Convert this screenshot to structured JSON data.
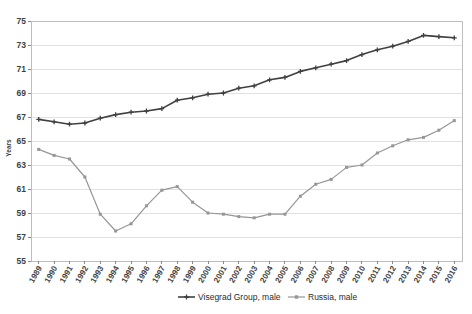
{
  "chart_data": {
    "type": "line",
    "title": "",
    "xlabel": "",
    "ylabel": "Years",
    "ylim": [
      55,
      75
    ],
    "ytick_step": 2,
    "yticks": [
      55,
      57,
      59,
      61,
      63,
      65,
      67,
      69,
      71,
      73,
      75
    ],
    "grid": true,
    "legend_position": "bottom",
    "x": [
      1989,
      1990,
      1991,
      1992,
      1993,
      1994,
      1995,
      1996,
      1997,
      1998,
      1999,
      2000,
      2001,
      2002,
      2003,
      2004,
      2005,
      2006,
      2007,
      2008,
      2009,
      2010,
      2011,
      2012,
      2013,
      2014,
      2015,
      2016
    ],
    "categories": [
      "1989",
      "1990",
      "1991",
      "1992",
      "1993",
      "1994",
      "1995",
      "1996",
      "1997",
      "1998",
      "1999",
      "2000",
      "2001",
      "2002",
      "2003",
      "2004",
      "2005",
      "2006",
      "2007",
      "2008",
      "2009",
      "2010",
      "2011",
      "2012",
      "2013",
      "2014",
      "2015",
      "2016"
    ],
    "series": [
      {
        "name": "Visegrad Group, male",
        "color": "#404040",
        "marker": "plus",
        "values": [
          66.8,
          66.6,
          66.4,
          66.5,
          66.9,
          67.2,
          67.4,
          67.5,
          67.7,
          68.4,
          68.6,
          68.9,
          69.0,
          69.4,
          69.6,
          70.1,
          70.3,
          70.8,
          71.1,
          71.4,
          71.7,
          72.2,
          72.6,
          72.9,
          73.3,
          73.8,
          73.7,
          73.6
        ]
      },
      {
        "name": "Russia, male",
        "color": "#969696",
        "marker": "square",
        "values": [
          64.3,
          63.8,
          63.5,
          62.0,
          58.9,
          57.5,
          58.1,
          59.6,
          60.9,
          61.2,
          59.9,
          59.0,
          58.9,
          58.7,
          58.6,
          58.9,
          58.9,
          60.4,
          61.4,
          61.8,
          62.8,
          63.0,
          64.0,
          64.6,
          65.1,
          65.3,
          65.9,
          66.7
        ]
      }
    ]
  },
  "legend": {
    "items": [
      {
        "label": "Visegrad Group, male"
      },
      {
        "label": "Russia, male"
      }
    ]
  },
  "axes": {
    "y_title": "Years"
  }
}
